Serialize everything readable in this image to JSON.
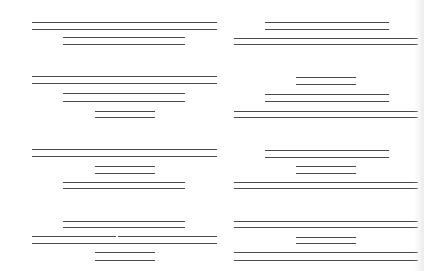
{
  "diagram": {
    "line_color": "#4a4a4a",
    "background": "#ffffff",
    "lengths": {
      "short": 60,
      "medium": 122,
      "long_left": 185,
      "long_right": 184
    },
    "segments": [
      {
        "id": "r1-left-long-a",
        "x": 32,
        "y": 22,
        "w": 185
      },
      {
        "id": "r1-left-long-b",
        "x": 32,
        "y": 29,
        "w": 185
      },
      {
        "id": "r1-left-med-a",
        "x": 63,
        "y": 37,
        "w": 122
      },
      {
        "id": "r1-left-med-b",
        "x": 63,
        "y": 44,
        "w": 122
      },
      {
        "id": "r1-right-med-a",
        "x": 265,
        "y": 22,
        "w": 124
      },
      {
        "id": "r1-right-med-b",
        "x": 265,
        "y": 29,
        "w": 124
      },
      {
        "id": "r1-right-long-a",
        "x": 234,
        "y": 38,
        "w": 184
      },
      {
        "id": "r1-right-long-b",
        "x": 234,
        "y": 44,
        "w": 184
      },
      {
        "id": "r2-left-long-a",
        "x": 32,
        "y": 76,
        "w": 185
      },
      {
        "id": "r2-left-long-b",
        "x": 32,
        "y": 83,
        "w": 185
      },
      {
        "id": "r2-left-med-a",
        "x": 63,
        "y": 93,
        "w": 122
      },
      {
        "id": "r2-left-med-b",
        "x": 63,
        "y": 101,
        "w": 122
      },
      {
        "id": "r2-left-short-a",
        "x": 95,
        "y": 111,
        "w": 60
      },
      {
        "id": "r2-left-short-b",
        "x": 95,
        "y": 117,
        "w": 60
      },
      {
        "id": "r2-right-short-a",
        "x": 296,
        "y": 77,
        "w": 60
      },
      {
        "id": "r2-right-short-b",
        "x": 296,
        "y": 84,
        "w": 60
      },
      {
        "id": "r2-right-med-a",
        "x": 265,
        "y": 94,
        "w": 124
      },
      {
        "id": "r2-right-med-b",
        "x": 265,
        "y": 101,
        "w": 124
      },
      {
        "id": "r2-right-long-a",
        "x": 234,
        "y": 111,
        "w": 184
      },
      {
        "id": "r2-right-long-b",
        "x": 234,
        "y": 117,
        "w": 184
      },
      {
        "id": "r3-left-long-a",
        "x": 32,
        "y": 149,
        "w": 185
      },
      {
        "id": "r3-left-long-b",
        "x": 32,
        "y": 156,
        "w": 185
      },
      {
        "id": "r3-left-short-a",
        "x": 95,
        "y": 166,
        "w": 60
      },
      {
        "id": "r3-left-short-b",
        "x": 95,
        "y": 173,
        "w": 60
      },
      {
        "id": "r3-left-med-a",
        "x": 63,
        "y": 182,
        "w": 122
      },
      {
        "id": "r3-left-med-b",
        "x": 63,
        "y": 188,
        "w": 122
      },
      {
        "id": "r3-right-med-a",
        "x": 265,
        "y": 150,
        "w": 124
      },
      {
        "id": "r3-right-med-b",
        "x": 265,
        "y": 157,
        "w": 124
      },
      {
        "id": "r3-right-short-a",
        "x": 296,
        "y": 166,
        "w": 60
      },
      {
        "id": "r3-right-short-b",
        "x": 296,
        "y": 173,
        "w": 60
      },
      {
        "id": "r3-right-long-a",
        "x": 234,
        "y": 182,
        "w": 184
      },
      {
        "id": "r3-right-long-b",
        "x": 234,
        "y": 188,
        "w": 184
      },
      {
        "id": "r4-left-med-a",
        "x": 63,
        "y": 221,
        "w": 122
      },
      {
        "id": "r4-left-med-b",
        "x": 63,
        "y": 227,
        "w": 122
      },
      {
        "id": "r4-left-long-a",
        "x": 32,
        "y": 236,
        "w": 185
      },
      {
        "id": "r4-left-long-b",
        "x": 32,
        "y": 243,
        "w": 185
      },
      {
        "id": "r4-left-short-a",
        "x": 95,
        "y": 252,
        "w": 60
      },
      {
        "id": "r4-left-short-b",
        "x": 95,
        "y": 260,
        "w": 60
      },
      {
        "id": "r4-right-long-a",
        "x": 234,
        "y": 221,
        "w": 184
      },
      {
        "id": "r4-right-long-b",
        "x": 234,
        "y": 227,
        "w": 184
      },
      {
        "id": "r4-right-short-a",
        "x": 296,
        "y": 237,
        "w": 60
      },
      {
        "id": "r4-right-short-b",
        "x": 296,
        "y": 243,
        "w": 60
      },
      {
        "id": "r4-right-long2-a",
        "x": 234,
        "y": 252,
        "w": 184
      },
      {
        "id": "r4-right-long2-b",
        "x": 234,
        "y": 260,
        "w": 184
      }
    ],
    "gaps": [
      {
        "id": "r4-left-long-a-gap",
        "x": 116,
        "y": 235
      }
    ]
  }
}
